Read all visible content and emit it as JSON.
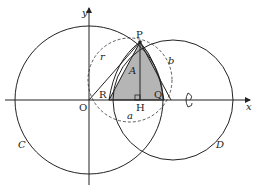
{
  "labels": {
    "y_axis": "y",
    "x_axis": "x",
    "P": "P",
    "O": "O",
    "R": "R",
    "H": "H",
    "Q": "Q",
    "A": "A",
    "r": "r",
    "a": "a",
    "b": "b",
    "C": "C",
    "D": "D"
  },
  "colors": {
    "line": "#222222",
    "fill": "#b5b5b5"
  }
}
